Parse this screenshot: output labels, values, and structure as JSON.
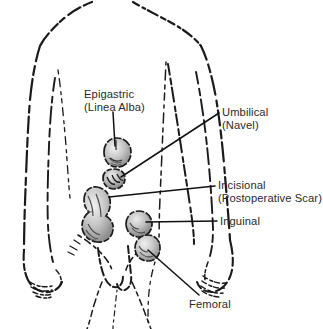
{
  "figure": {
    "colors": {
      "background": "#ffffff",
      "ink": "#1a1a1a",
      "text": "#2a2a2a",
      "leader_line": "#111111",
      "bulge_shade": "#9a9a9a"
    }
  },
  "labels": {
    "epigastric": {
      "line1": "Epigastric",
      "line2": "(Linea Alba)"
    },
    "umbilical": {
      "line1": "Umbilical",
      "line2": "(Navel)"
    },
    "incisional": {
      "line1": "Incisional",
      "line2": "(Postoperative Scar)"
    },
    "inguinal": {
      "line1": "Inguinal",
      "line2": ""
    },
    "femoral": {
      "line1": "Femoral",
      "line2": ""
    }
  },
  "hernia_sites": [
    {
      "name": "epigastric",
      "label": "Epigastric (Linea Alba)",
      "x": 117,
      "y": 152
    },
    {
      "name": "umbilical",
      "label": "Umbilical (Navel)",
      "x": 113,
      "y": 180
    },
    {
      "name": "incisional",
      "label": "Incisional (Postoperative Scar)",
      "x": 98,
      "y": 203
    },
    {
      "name": "inguinal",
      "label": "Inguinal",
      "x": 137,
      "y": 224
    },
    {
      "name": "femoral",
      "label": "Femoral",
      "x": 146,
      "y": 248
    }
  ],
  "leader_lines": [
    {
      "name": "epigastric-leader",
      "x1": 113,
      "y1": 112,
      "x2": 115,
      "y2": 146
    },
    {
      "name": "umbilical-leader",
      "x1": 121,
      "y1": 177,
      "x2": 219,
      "y2": 113
    },
    {
      "name": "incisional-leader",
      "x1": 109,
      "y1": 197,
      "x2": 215,
      "y2": 186
    },
    {
      "name": "inguinal-leader",
      "x1": 146,
      "y1": 222,
      "x2": 217,
      "y2": 221
    },
    {
      "name": "femoral-leader",
      "x1": 148,
      "y1": 250,
      "x2": 199,
      "y2": 295
    }
  ]
}
